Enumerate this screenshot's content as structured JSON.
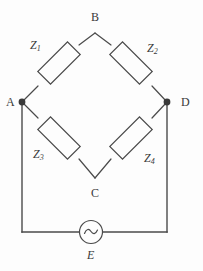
{
  "figure": {
    "background_color": "#fdfdfd",
    "line_color": "#4a4a4a",
    "text_color": "#3a3a3a"
  },
  "nodes": [
    {
      "id": "B",
      "label": "B",
      "role": "top-bridge-node"
    },
    {
      "id": "A",
      "label": "A",
      "role": "left-bridge-node"
    },
    {
      "id": "D",
      "label": "D",
      "role": "right-bridge-node"
    },
    {
      "id": "C",
      "label": "C",
      "role": "bottom-bridge-node"
    }
  ],
  "components": [
    {
      "id": "Z1",
      "symbol": "Z",
      "subscript": "1",
      "type": "impedance",
      "branch": "A-B"
    },
    {
      "id": "Z2",
      "symbol": "Z",
      "subscript": "2",
      "type": "impedance",
      "branch": "B-D"
    },
    {
      "id": "Z3",
      "symbol": "Z",
      "subscript": "3",
      "type": "impedance",
      "branch": "A-C"
    },
    {
      "id": "Z4",
      "symbol": "Z",
      "subscript": "4",
      "type": "impedance",
      "branch": "C-D"
    }
  ],
  "source": {
    "id": "E",
    "label": "E",
    "type": "ac-voltage-source",
    "symbol_glyph": "~"
  }
}
